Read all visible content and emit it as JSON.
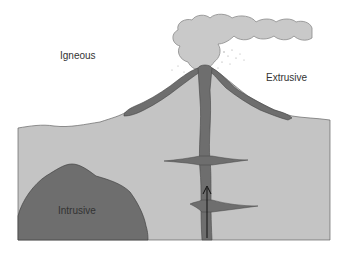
{
  "diagram": {
    "labels": {
      "igneous": "Igneous",
      "extrusive": "Extrusive",
      "intrusive": "Intrusive"
    },
    "colors": {
      "background": "#ffffff",
      "ground": "#c4c4c4",
      "magma": "#6e6e6e",
      "ash_cloud": "#c9c9c9",
      "outline": "#444444",
      "text": "#333333"
    },
    "elements": [
      "ash-cloud",
      "volcano-cone",
      "lava-flow-left",
      "lava-flow-right",
      "central-vent-conduit",
      "upper-sill",
      "lower-sill",
      "batholith-intrusion",
      "magma-rise-arrow"
    ]
  }
}
